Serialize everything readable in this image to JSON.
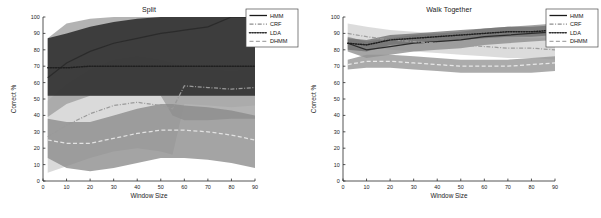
{
  "figure": {
    "background": "#ffffff",
    "width": 601,
    "height": 218
  },
  "axes": {
    "xlabel": "Window Size",
    "ylabel": "Correct %",
    "xticks": [
      0,
      10,
      20,
      30,
      40,
      50,
      60,
      70,
      80,
      90
    ],
    "yticks": [
      0,
      10,
      20,
      30,
      40,
      50,
      60,
      70,
      80,
      90,
      100
    ],
    "xlim": [
      0,
      90
    ],
    "ylim": [
      0,
      100
    ],
    "grid": false
  },
  "legend": {
    "position": "top-right",
    "entries": [
      {
        "label": "HMM",
        "style": "solid",
        "color": "#1a1a1a"
      },
      {
        "label": "CRF",
        "style": "dashdot",
        "color": "#8d8d8d"
      },
      {
        "label": "LDA",
        "style": "dotted",
        "color": "#2f2f2f"
      },
      {
        "label": "DHMM",
        "style": "dashed",
        "color": "#a8a8a8"
      }
    ]
  },
  "chart_data": [
    {
      "type": "line",
      "title": "Split",
      "xlabel": "Window Size",
      "ylabel": "Correct %",
      "xlim": [
        0,
        90
      ],
      "ylim": [
        0,
        100
      ],
      "grid": false,
      "legend_position": "top-right",
      "x": [
        2,
        10,
        20,
        30,
        40,
        50,
        55,
        60,
        70,
        80,
        90
      ],
      "series": [
        {
          "name": "HMM",
          "style": "solid",
          "color": "#2b2b2b",
          "values": [
            63,
            72,
            79,
            84,
            87,
            90,
            91,
            92,
            94,
            100,
            100
          ],
          "band_lower": [
            39,
            47,
            52,
            52,
            52,
            52,
            40,
            37,
            37,
            38,
            38
          ],
          "band_upper": [
            87,
            96,
            99,
            100,
            100,
            100,
            100,
            100,
            100,
            100,
            100
          ],
          "band_color": "#9e9e9e"
        },
        {
          "name": "CRF",
          "style": "dashdot",
          "color": "#9a9a9a",
          "values": [
            27,
            34,
            41,
            46,
            48,
            46,
            44,
            58,
            57,
            56,
            57
          ],
          "band_lower": [
            5,
            9,
            14,
            18,
            20,
            18,
            16,
            47,
            46,
            45,
            46
          ],
          "band_upper": [
            49,
            59,
            68,
            74,
            76,
            74,
            72,
            69,
            68,
            67,
            68
          ],
          "band_color": "#cfcfcf"
        },
        {
          "name": "LDA",
          "style": "dotted",
          "color": "#1f1f1f",
          "values": [
            69,
            69,
            70,
            70,
            70,
            70,
            70,
            70,
            70,
            70,
            70
          ],
          "band_lower": [
            52,
            52,
            52,
            52,
            52,
            52,
            52,
            52,
            52,
            52,
            52
          ],
          "band_upper": [
            87,
            90,
            94,
            97,
            99,
            100,
            100,
            100,
            100,
            100,
            100
          ],
          "band_color": "#1c1c1c"
        },
        {
          "name": "DHMM",
          "style": "dashed",
          "color": "#e2e2e2",
          "values": [
            25,
            23,
            23,
            26,
            29,
            31,
            31,
            31,
            30,
            28,
            25
          ],
          "band_lower": [
            14,
            8,
            6,
            8,
            11,
            14,
            14,
            14,
            13,
            11,
            8
          ],
          "band_upper": [
            38,
            36,
            36,
            40,
            44,
            47,
            47,
            46,
            45,
            43,
            40
          ],
          "band_color": "#8a8a8a"
        }
      ]
    },
    {
      "type": "line",
      "title": "Walk Together",
      "xlabel": "Window Size",
      "ylabel": "Correct %",
      "xlim": [
        0,
        90
      ],
      "ylim": [
        0,
        100
      ],
      "grid": false,
      "legend_position": "top-right",
      "x": [
        2,
        10,
        20,
        30,
        40,
        50,
        60,
        70,
        80,
        90
      ],
      "series": [
        {
          "name": "HMM",
          "style": "solid",
          "color": "#2b2b2b",
          "values": [
            84,
            80,
            82,
            84,
            85,
            86,
            88,
            89,
            90,
            91
          ],
          "band_lower": [
            79,
            75,
            77,
            79,
            80,
            81,
            83,
            84,
            85,
            86
          ],
          "band_upper": [
            88,
            85,
            87,
            89,
            90,
            91,
            93,
            94,
            95,
            96
          ],
          "band_color": "#8c8c8c"
        },
        {
          "name": "CRF",
          "style": "dashdot",
          "color": "#9d9d9d",
          "values": [
            90,
            88,
            86,
            85,
            84,
            83,
            82,
            81,
            81,
            80
          ],
          "band_lower": [
            84,
            82,
            80,
            79,
            78,
            77,
            76,
            75,
            75,
            74
          ],
          "band_upper": [
            96,
            94,
            92,
            91,
            90,
            89,
            88,
            88,
            87,
            87
          ],
          "band_color": "#d2d2d2"
        },
        {
          "name": "LDA",
          "style": "dotted",
          "color": "#1f1f1f",
          "values": [
            84,
            83,
            86,
            87,
            88,
            89,
            90,
            91,
            91,
            92
          ],
          "band_lower": [
            80,
            79,
            83,
            84,
            85,
            86,
            87,
            88,
            88,
            89
          ],
          "band_upper": [
            87,
            86,
            89,
            90,
            91,
            92,
            93,
            94,
            94,
            95
          ],
          "band_color": "#6f6f6f"
        },
        {
          "name": "DHMM",
          "style": "dashed",
          "color": "#e8e8e8",
          "values": [
            71,
            73,
            73,
            72,
            71,
            70,
            70,
            70,
            71,
            72
          ],
          "band_lower": [
            68,
            69,
            69,
            68,
            67,
            66,
            66,
            66,
            66,
            67
          ],
          "band_upper": [
            74,
            77,
            77,
            76,
            75,
            74,
            74,
            74,
            75,
            76
          ],
          "band_color": "#949494"
        }
      ]
    }
  ]
}
